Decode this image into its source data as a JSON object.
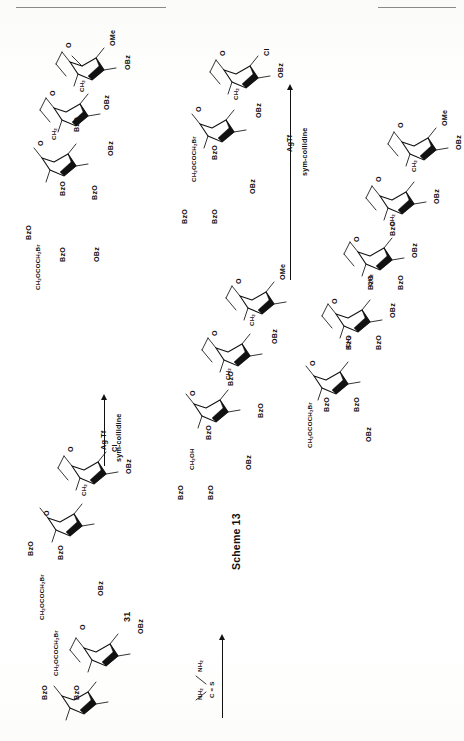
{
  "page": {
    "kind": "scanned-journal-page",
    "caption": "Scheme 13",
    "orientation": "landscape-rotated-90",
    "background_color": "#ffffff",
    "ink_color": "#111111"
  },
  "compound_labels": [
    {
      "id": "compound-31",
      "text": "31"
    }
  ],
  "reagent_arrows": [
    {
      "id": "arrow-thiourea",
      "above_text": "",
      "below_text": "",
      "reagent_structure": "(NH2)2C=S",
      "reagent_parts": {
        "top": "NH",
        "top_sub": "2",
        "bottom": "NH",
        "bottom_sub": "2",
        "center": "C",
        "double_bond": "=",
        "terminal": "S"
      }
    },
    {
      "id": "arrow-agtf-left",
      "above_text": "Ag Tf",
      "below_text": "sym-collidine"
    },
    {
      "id": "arrow-agtf-right",
      "above_text": "AgTf",
      "below_text": "sym-collidine"
    }
  ],
  "structures": [
    {
      "id": "structure-top-left-trisaccharide",
      "position": "top-left",
      "residues": 3,
      "substituent_labels": [
        "OMe",
        "OBz",
        "O",
        "CH",
        "OBz",
        "BzO",
        "OBz",
        "O",
        "CH",
        "BzO",
        "BzO",
        "O",
        "OBz",
        "CH",
        "OCOCH",
        "Br",
        "BzO",
        "BzO"
      ],
      "atom_labels": [
        {
          "text": "OMe"
        },
        {
          "text": "OBz"
        },
        {
          "text": "O"
        },
        {
          "text": "CH2"
        },
        {
          "text": "OBz"
        },
        {
          "text": "BzO"
        },
        {
          "text": "OBz"
        },
        {
          "text": "O"
        },
        {
          "text": "CH2"
        },
        {
          "text": "BzO"
        },
        {
          "text": "BzO"
        },
        {
          "text": "O"
        },
        {
          "text": "OBz"
        },
        {
          "text": "CH2OCOCH2Br"
        },
        {
          "text": "BzO"
        },
        {
          "text": "BzO"
        }
      ]
    },
    {
      "id": "structure-left-disaccharide-chloride",
      "position": "left-lower",
      "residues": 2,
      "atom_labels": [
        {
          "text": "Cl"
        },
        {
          "text": "OBz"
        },
        {
          "text": "O"
        },
        {
          "text": "CH2"
        },
        {
          "text": "BzO"
        },
        {
          "text": "BzO"
        },
        {
          "text": "CH2OCOCH2Br"
        },
        {
          "text": "O"
        },
        {
          "text": "OBz"
        },
        {
          "text": "BzO"
        },
        {
          "text": "BzO"
        }
      ]
    },
    {
      "id": "structure-mid-trisaccharide-ome-ch2oh",
      "position": "middle-column",
      "residues": 3,
      "atom_labels": [
        {
          "text": "OMe"
        },
        {
          "text": "O"
        },
        {
          "text": "CH2"
        },
        {
          "text": "OBz"
        },
        {
          "text": "BzO"
        },
        {
          "text": "O"
        },
        {
          "text": "CH2"
        },
        {
          "text": "BzO"
        },
        {
          "text": "BzO"
        },
        {
          "text": "CH2OH"
        },
        {
          "text": "O"
        },
        {
          "text": "OBz"
        },
        {
          "text": "BzO"
        },
        {
          "text": "BzO"
        }
      ]
    },
    {
      "id": "structure-mid-upper-disaccharide-chloride",
      "position": "middle-upper",
      "residues": 2,
      "atom_labels": [
        {
          "text": "Cl"
        },
        {
          "text": "OBz"
        },
        {
          "text": "O"
        },
        {
          "text": "CH2"
        },
        {
          "text": "OBz"
        },
        {
          "text": "BzO"
        },
        {
          "text": "CH2OCOCH2Br"
        },
        {
          "text": "O"
        },
        {
          "text": "OBz"
        },
        {
          "text": "BzO"
        },
        {
          "text": "BzO"
        }
      ]
    },
    {
      "id": "structure-right-pentasaccharide",
      "position": "right-column",
      "residues": 5,
      "atom_labels": [
        {
          "text": "OMe"
        },
        {
          "text": "OBz"
        },
        {
          "text": "O"
        },
        {
          "text": "CH2"
        },
        {
          "text": "BzO"
        },
        {
          "text": "OBz"
        },
        {
          "text": "O"
        },
        {
          "text": "CH2"
        },
        {
          "text": "BzO"
        },
        {
          "text": "BzO"
        },
        {
          "text": "OBz"
        },
        {
          "text": "O"
        },
        {
          "text": "CH2"
        },
        {
          "text": "BzO"
        },
        {
          "text": "BzO"
        },
        {
          "text": "OBz"
        },
        {
          "text": "O"
        },
        {
          "text": "CH2"
        },
        {
          "text": "BzO"
        },
        {
          "text": "BzO"
        },
        {
          "text": "CH2OCOCH2Br"
        },
        {
          "text": "O"
        },
        {
          "text": "OBz"
        },
        {
          "text": "BzO"
        },
        {
          "text": "BzO"
        }
      ]
    }
  ]
}
